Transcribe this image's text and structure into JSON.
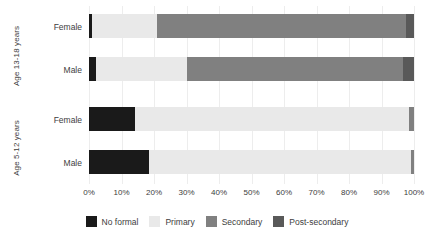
{
  "chart_data": {
    "type": "bar",
    "orientation": "horizontal",
    "stacked": true,
    "stack_mode": "percent",
    "title": "",
    "xlabel": "",
    "ylabel": "",
    "xlim": [
      0,
      100
    ],
    "xticks": [
      "0%",
      "10%",
      "20%",
      "30%",
      "40%",
      "50%",
      "60%",
      "70%",
      "80%",
      "90%",
      "100%"
    ],
    "xtick_values": [
      0,
      10,
      20,
      30,
      40,
      50,
      60,
      70,
      80,
      90,
      100
    ],
    "grid": true,
    "legend_position": "bottom",
    "groups": [
      {
        "group_label": "Age 13-18 years",
        "rows": [
          {
            "category": "Female",
            "values": [
              1,
              20,
              76.5,
              2.5
            ]
          },
          {
            "category": "Male",
            "values": [
              2,
              28,
              66.5,
              3.5
            ]
          }
        ]
      },
      {
        "group_label": "Age 5-12 years",
        "rows": [
          {
            "category": "Female",
            "values": [
              14,
              84.5,
              1.5,
              0
            ]
          },
          {
            "category": "Male",
            "values": [
              18.5,
              80.5,
              1,
              0
            ]
          }
        ]
      }
    ],
    "series": [
      {
        "name": "No formal",
        "color": "#1a1a1a"
      },
      {
        "name": "Primary",
        "color": "#e9e9e9"
      },
      {
        "name": "Secondary",
        "color": "#808080"
      },
      {
        "name": "Post-secondary",
        "color": "#595959"
      }
    ]
  },
  "legend": {
    "items": [
      {
        "label": "No formal",
        "color": "#1a1a1a"
      },
      {
        "label": "Primary",
        "color": "#e9e9e9"
      },
      {
        "label": "Secondary",
        "color": "#808080"
      },
      {
        "label": "Post-secondary",
        "color": "#595959"
      }
    ]
  },
  "axis": {
    "group_labels": [
      "Age 13-18 years",
      "Age 5-12 years"
    ],
    "category_labels": [
      "Female",
      "Male",
      "Female",
      "Male"
    ],
    "xticks": [
      "0%",
      "10%",
      "20%",
      "30%",
      "40%",
      "50%",
      "60%",
      "70%",
      "80%",
      "90%",
      "100%"
    ]
  },
  "colors": {
    "gridline": "#ededed",
    "text": "#3d3d3d",
    "background": "#ffffff"
  }
}
